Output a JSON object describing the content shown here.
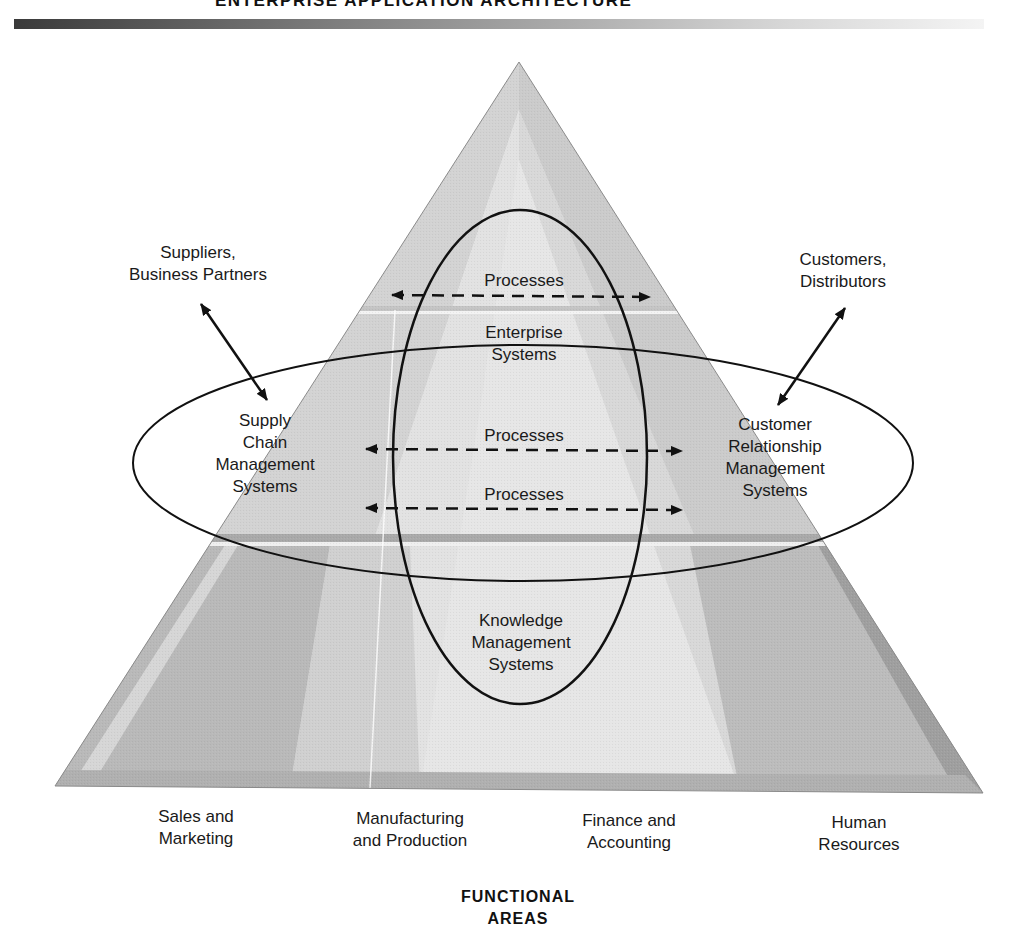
{
  "header": {
    "title": "ENTERPRISE APPLICATION ARCHITECTURE"
  },
  "external": {
    "suppliers": "Suppliers,\nBusiness Partners",
    "customers": "Customers,\nDistributors"
  },
  "systems": {
    "enterprise": "Enterprise\nSystems",
    "supply_chain": "Supply\nChain\nManagement\nSystems",
    "crm": "Customer\nRelationship\nManagement\nSystems",
    "knowledge": "Knowledge\nManagement\nSystems"
  },
  "processes": [
    {
      "label": "Processes"
    },
    {
      "label": "Processes"
    },
    {
      "label": "Processes"
    }
  ],
  "functional_areas": {
    "title": "FUNCTIONAL\nAREAS",
    "items": [
      {
        "label": "Sales and\nMarketing"
      },
      {
        "label": "Manufacturing\nand Production"
      },
      {
        "label": "Finance and\nAccounting"
      },
      {
        "label": "Human\nResources"
      }
    ]
  },
  "colors": {
    "pyramid_light": "#e4e4e4",
    "pyramid_mid": "#cfcfcf",
    "pyramid_dark": "#b4b4b4",
    "stroke": "#111111"
  }
}
